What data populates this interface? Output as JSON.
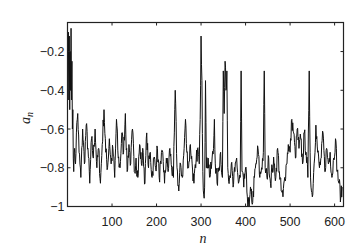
{
  "chart_data": {
    "type": "line",
    "title": "",
    "xlabel": "n",
    "ylabel": "a_n",
    "xlim": [
      0,
      620
    ],
    "ylim": [
      -1,
      -0.05
    ],
    "grid": false,
    "legend": null,
    "x_ticks": [
      100,
      200,
      300,
      400,
      500,
      600
    ],
    "x_tick_labels": [
      "100",
      "200",
      "300",
      "400",
      "500",
      "600"
    ],
    "y_ticks": [
      -0.2,
      -0.4,
      -0.6,
      -0.8,
      -1
    ],
    "y_tick_labels": [
      "-0.2",
      "-0.4",
      "-0.6",
      "-0.8",
      "-1"
    ],
    "series": [
      {
        "name": "a_n",
        "color": "#111111",
        "keypoints_x": [
          0,
          2,
          3,
          4,
          5,
          6,
          7,
          8,
          9,
          10,
          11,
          12,
          13,
          14,
          16,
          18,
          20,
          23,
          26,
          30,
          34,
          38,
          42,
          46,
          50,
          54,
          58,
          62,
          66,
          70,
          74,
          78,
          82,
          86,
          90,
          94,
          98,
          102,
          106,
          110,
          114,
          118,
          122,
          126,
          130,
          134,
          138,
          142,
          146,
          150,
          154,
          158,
          162,
          166,
          170,
          174,
          178,
          182,
          186,
          190,
          194,
          198,
          202,
          206,
          210,
          214,
          218,
          222,
          226,
          230,
          234,
          238,
          240,
          242,
          246,
          250,
          254,
          258,
          262,
          265,
          268,
          272,
          276,
          280,
          284,
          288,
          292,
          296,
          298,
          300,
          302,
          304,
          306,
          308,
          310,
          312,
          316,
          320,
          324,
          328,
          330,
          332,
          336,
          340,
          344,
          348,
          350,
          352,
          354,
          356,
          358,
          360,
          364,
          368,
          372,
          376,
          380,
          384,
          388,
          390,
          392,
          396,
          400,
          404,
          408,
          412,
          416,
          420,
          424,
          428,
          432,
          436,
          440,
          442,
          444,
          448,
          452,
          456,
          460,
          464,
          468,
          472,
          476,
          480,
          484,
          488,
          492,
          496,
          500,
          504,
          508,
          512,
          516,
          520,
          524,
          528,
          532,
          536,
          540,
          543,
          545,
          547,
          550,
          554,
          558,
          562,
          566,
          570,
          574,
          578,
          582,
          586,
          590,
          594,
          598,
          602,
          606,
          610,
          614,
          618,
          620
        ],
        "keypoints_y": [
          -0.35,
          -0.1,
          -0.45,
          -0.12,
          -0.5,
          -0.2,
          -0.4,
          -0.08,
          -0.45,
          -0.25,
          -0.6,
          -0.5,
          -0.75,
          -0.82,
          -0.7,
          -0.78,
          -0.62,
          -0.52,
          -0.72,
          -0.85,
          -0.6,
          -0.78,
          -0.58,
          -0.7,
          -0.88,
          -0.65,
          -0.75,
          -0.6,
          -0.8,
          -0.7,
          -0.88,
          -0.68,
          -0.5,
          -0.72,
          -0.8,
          -0.65,
          -0.78,
          -0.7,
          -0.85,
          -0.55,
          -0.75,
          -0.8,
          -0.62,
          -0.72,
          -0.52,
          -0.82,
          -0.68,
          -0.78,
          -0.6,
          -0.82,
          -0.75,
          -0.85,
          -0.68,
          -0.78,
          -0.72,
          -0.88,
          -0.62,
          -0.8,
          -0.72,
          -0.85,
          -0.75,
          -0.8,
          -0.7,
          -0.85,
          -0.78,
          -0.72,
          -0.88,
          -0.75,
          -0.82,
          -0.7,
          -0.8,
          -0.85,
          -0.62,
          -0.4,
          -0.8,
          -0.92,
          -0.78,
          -0.85,
          -0.7,
          -0.55,
          -0.72,
          -0.8,
          -0.68,
          -0.78,
          -0.88,
          -0.8,
          -0.7,
          -0.78,
          -0.55,
          -0.12,
          -0.35,
          -0.82,
          -0.94,
          -0.9,
          -0.35,
          -0.8,
          -0.75,
          -0.85,
          -0.78,
          -0.7,
          -0.55,
          -0.78,
          -0.88,
          -0.8,
          -0.72,
          -0.85,
          -0.3,
          -0.52,
          -0.25,
          -0.4,
          -0.3,
          -0.8,
          -0.85,
          -0.78,
          -0.9,
          -0.82,
          -0.75,
          -0.88,
          -0.85,
          -0.3,
          -0.82,
          -0.9,
          -0.8,
          -0.95,
          -1.0,
          -0.92,
          -0.98,
          -0.85,
          -0.78,
          -0.7,
          -0.85,
          -0.8,
          -0.72,
          -0.3,
          -0.8,
          -0.85,
          -0.75,
          -0.88,
          -0.8,
          -0.78,
          -0.85,
          -0.7,
          -0.82,
          -0.92,
          -0.95,
          -0.85,
          -0.78,
          -0.68,
          -0.72,
          -0.55,
          -0.62,
          -0.75,
          -0.6,
          -0.7,
          -0.65,
          -0.78,
          -0.62,
          -0.72,
          -0.85,
          -0.3,
          -0.72,
          -0.9,
          -0.95,
          -0.78,
          -0.58,
          -0.72,
          -0.8,
          -0.75,
          -0.62,
          -0.82,
          -0.7,
          -0.78,
          -0.72,
          -0.85,
          -0.75,
          -0.65,
          -0.82,
          -0.88,
          -0.95,
          -0.9
        ]
      }
    ]
  }
}
